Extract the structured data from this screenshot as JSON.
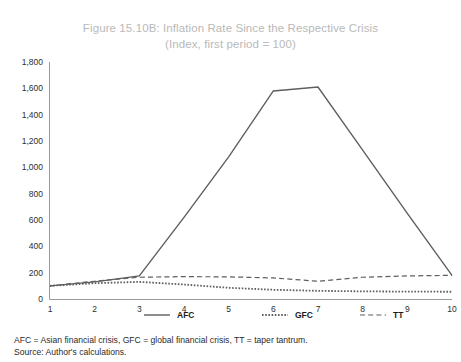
{
  "figure": {
    "title_line1": "Figure 15.10B: Inflation Rate Since the Respective Crisis",
    "title_line2": "(Index, first period = 100)",
    "title_color": "#b9b9b9"
  },
  "footnotes": {
    "line1": "AFC = Asian financial crisis, GFC = global financial crisis, TT = taper tantrum.",
    "line2": "Source: Author's calculations."
  },
  "chart_data": {
    "type": "line",
    "title": "Figure 15.10B: Inflation Rate Since the Respective Crisis",
    "subtitle": "(Index, first period = 100)",
    "xlabel": "",
    "ylabel": "",
    "x": [
      1,
      2,
      3,
      4,
      5,
      6,
      7,
      8,
      9,
      10
    ],
    "xtick_labels": [
      "1",
      "2",
      "3",
      "4",
      "5",
      "6",
      "7",
      "8",
      "9",
      "10"
    ],
    "ytick_labels": [
      "0",
      "200",
      "400",
      "600",
      "800",
      "1,000",
      "1,200",
      "1,400",
      "1,600",
      "1,800"
    ],
    "ytick_values": [
      0,
      200,
      400,
      600,
      800,
      1000,
      1200,
      1400,
      1600,
      1800
    ],
    "ylim": [
      0,
      1800
    ],
    "xlim": [
      1,
      10
    ],
    "grid": false,
    "legend_position": "bottom",
    "line_color": "#5f5f5f",
    "series": [
      {
        "name": "AFC",
        "style": "solid",
        "values": [
          100,
          130,
          175,
          620,
          1080,
          1580,
          1610,
          1130,
          650,
          180
        ]
      },
      {
        "name": "GFC",
        "style": "dotted",
        "values": [
          100,
          120,
          130,
          110,
          85,
          70,
          62,
          58,
          56,
          55
        ]
      },
      {
        "name": "TT",
        "style": "dashed",
        "values": [
          100,
          135,
          165,
          170,
          168,
          160,
          135,
          165,
          175,
          180
        ]
      }
    ]
  }
}
